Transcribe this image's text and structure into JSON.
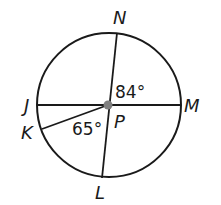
{
  "diagram": {
    "circle": {
      "cx": 109,
      "cy": 105,
      "r": 72,
      "stroke": "#1a1a1a"
    },
    "center": {
      "label": "P",
      "x": 108,
      "y": 105,
      "dot_color": "#808080"
    },
    "points": [
      {
        "id": "N",
        "label": "N",
        "x": 117,
        "y": 33,
        "label_x": 113,
        "label_y": 24
      },
      {
        "id": "M",
        "label": "M",
        "x": 181,
        "y": 105,
        "label_x": 185,
        "label_y": 113
      },
      {
        "id": "L",
        "label": "L",
        "x": 102,
        "y": 178,
        "label_x": 96,
        "label_y": 199
      },
      {
        "id": "J",
        "label": "J",
        "x": 38,
        "y": 105,
        "label_x": 23,
        "label_y": 113
      },
      {
        "id": "K",
        "label": "K",
        "x": 42,
        "y": 129,
        "label_x": 22,
        "label_y": 138
      }
    ],
    "segments": [
      {
        "from": "J",
        "to": "M"
      },
      {
        "from": "N",
        "to": "L"
      },
      {
        "from": "P",
        "to": "K"
      }
    ],
    "angles": [
      {
        "label": "84°",
        "between": [
          "N",
          "M"
        ],
        "x": 115,
        "y": 97
      },
      {
        "label": "65°",
        "between": [
          "K",
          "L"
        ],
        "x": 72,
        "y": 134
      }
    ]
  }
}
